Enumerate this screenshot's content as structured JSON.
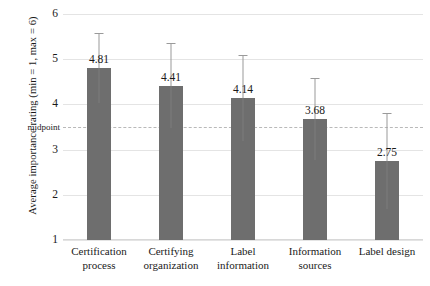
{
  "chart_data": {
    "type": "bar",
    "title": "",
    "xlabel": "",
    "ylabel": "Average importance rating (min = 1, max = 6)",
    "ylim": [
      1,
      6
    ],
    "yticks": [
      "6",
      "5",
      "4",
      "3",
      "2",
      "1"
    ],
    "ytick_values": [
      6,
      5,
      4,
      3,
      2,
      1
    ],
    "grid": true,
    "legend": "none",
    "categories": [
      "Certification process",
      "Certifying organization",
      "Label information",
      "Information sources",
      "Label design"
    ],
    "category_lines": [
      [
        "Certification",
        "process"
      ],
      [
        "Certifying",
        "organization"
      ],
      [
        "Label",
        "information"
      ],
      [
        "Information",
        "sources"
      ],
      [
        "Label design"
      ]
    ],
    "values": [
      4.81,
      4.41,
      4.14,
      3.68,
      2.75
    ],
    "value_labels": [
      "4.81",
      "4.41",
      "4.14",
      "3.68",
      "2.75"
    ],
    "error_upper": [
      5.58,
      5.35,
      5.09,
      4.59,
      3.81
    ],
    "error_lower": [
      4.04,
      3.47,
      3.19,
      2.77,
      1.69
    ],
    "annotations": [
      {
        "name": "midpoint",
        "label": "midpoint",
        "value": 3.5,
        "style": "dashed-horizontal-line"
      }
    ],
    "colors": {
      "bar_fill": "#6e6e6e",
      "gridline": "#e4e4e4",
      "midpoint_line": "#b9b9b9",
      "error_bar": "#9a9a9a",
      "text": "#1a1a1a",
      "background": "#ffffff"
    }
  }
}
